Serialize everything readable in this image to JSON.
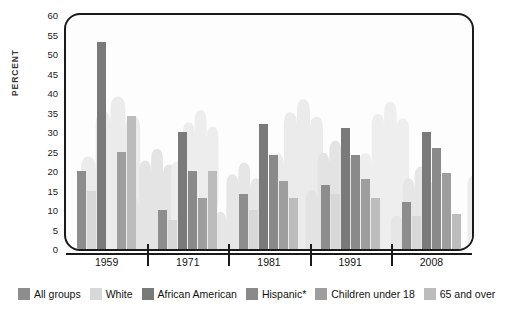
{
  "chart_data": {
    "type": "bar",
    "title": "",
    "xlabel": "",
    "ylabel": "PERCENT",
    "ylim": [
      0,
      60
    ],
    "ytick_step": 5,
    "yticks": [
      "60",
      "55",
      "50",
      "45",
      "40",
      "35",
      "30",
      "25",
      "20",
      "15",
      "10",
      "5",
      "0"
    ],
    "categories": [
      "1959",
      "1971",
      "1981",
      "1991",
      "2008"
    ],
    "grid": false,
    "legend_position": "bottom",
    "series": [
      {
        "name": "All groups",
        "color": "#8d8d8d",
        "values": [
          20,
          10,
          14,
          16.5,
          12
        ]
      },
      {
        "name": "White",
        "color": "#d8d8d8",
        "values": [
          15,
          7.5,
          10,
          14,
          8.5
        ]
      },
      {
        "name": "African American",
        "color": "#7a7a7a",
        "values": [
          53,
          30,
          32,
          31,
          30
        ]
      },
      {
        "name": "Hispanic*",
        "color": "#8a8a8a",
        "values": [
          null,
          20,
          24,
          24,
          26
        ]
      },
      {
        "name": "Children under 18",
        "color": "#9e9e9e",
        "values": [
          25,
          13,
          17.5,
          18,
          19.5
        ]
      },
      {
        "name": "65 and over",
        "color": "#bcbcbc",
        "values": [
          34,
          20,
          13,
          13,
          9
        ]
      }
    ]
  },
  "legend": {
    "items": [
      {
        "label": "All groups"
      },
      {
        "label": "White"
      },
      {
        "label": "African American"
      },
      {
        "label": "Hispanic*"
      },
      {
        "label": "Children under 18"
      },
      {
        "label": "65 and over"
      }
    ]
  },
  "colors": {
    "frame": "#1a1a1a",
    "plot_bg": "#fdfdfd",
    "hand_light": "#ececec",
    "hand_mid": "#e0e0e0",
    "hand_dark": "#d4d4d4"
  }
}
